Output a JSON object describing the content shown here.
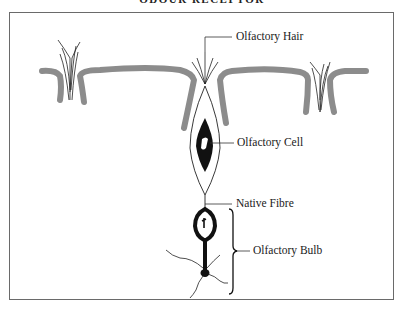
{
  "title": "ODOUR RECEPTOR",
  "labels": {
    "hair": "Olfactory Hair",
    "cell": "Olfactory Cell",
    "fibre": "Native Fibre",
    "bulb": "Olfactory Bulb"
  },
  "colors": {
    "epithelium": "#8c8c8c",
    "ink": "#111111",
    "frame": "#6a6a6a"
  }
}
